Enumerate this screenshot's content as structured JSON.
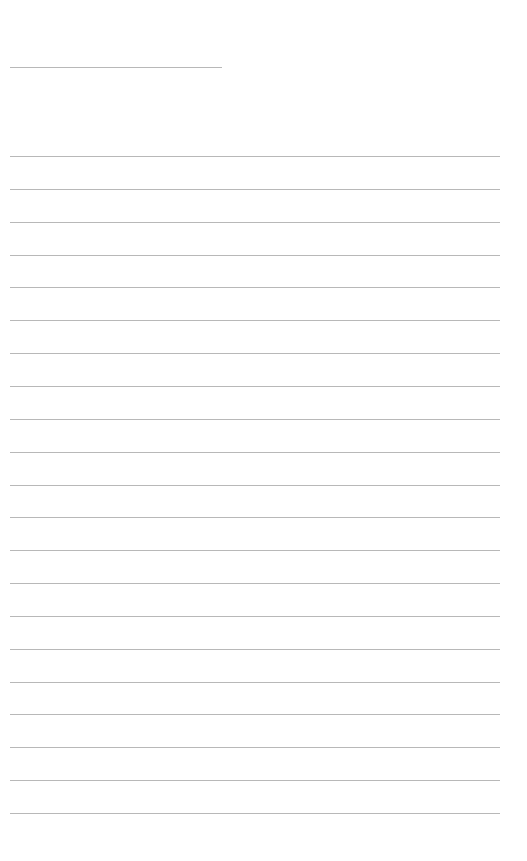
{
  "page": {
    "type": "lined-writing-sheet",
    "background_color": "#ffffff",
    "line_color": "#b8b8b8"
  },
  "title_line": {
    "label": "",
    "top": 67,
    "left": 10,
    "width": 212
  },
  "ruled_lines": {
    "count": 21,
    "first_top": 156,
    "spacing": 32.85,
    "left": 10,
    "width": 490
  }
}
